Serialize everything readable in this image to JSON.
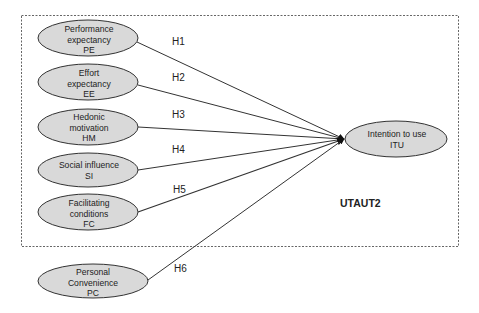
{
  "diagram": {
    "model_label": "UTAUT2",
    "colors": {
      "ellipse_fill": "#d9d9d9",
      "ellipse_stroke": "#333333",
      "line": "#333333",
      "box_dash": "#666666",
      "text": "#222222"
    },
    "constructs": [
      {
        "id": "PE",
        "lines": [
          "Performance",
          "expectancy",
          "PE"
        ],
        "hypothesis": "H1"
      },
      {
        "id": "EE",
        "lines": [
          "Effort",
          "expectancy",
          "EE"
        ],
        "hypothesis": "H2"
      },
      {
        "id": "HM",
        "lines": [
          "Hedonic",
          "motivation",
          "HM"
        ],
        "hypothesis": "H3"
      },
      {
        "id": "SI",
        "lines": [
          "Social influence",
          "SI"
        ],
        "hypothesis": "H4"
      },
      {
        "id": "FC",
        "lines": [
          "Facilitating",
          "conditions",
          "FC"
        ],
        "hypothesis": "H5"
      },
      {
        "id": "PC",
        "lines": [
          "Personal",
          "Convenience",
          "PC"
        ],
        "hypothesis": "H6"
      }
    ],
    "outcome": {
      "id": "ITU",
      "lines": [
        "Intention to use",
        "ITU"
      ]
    }
  }
}
